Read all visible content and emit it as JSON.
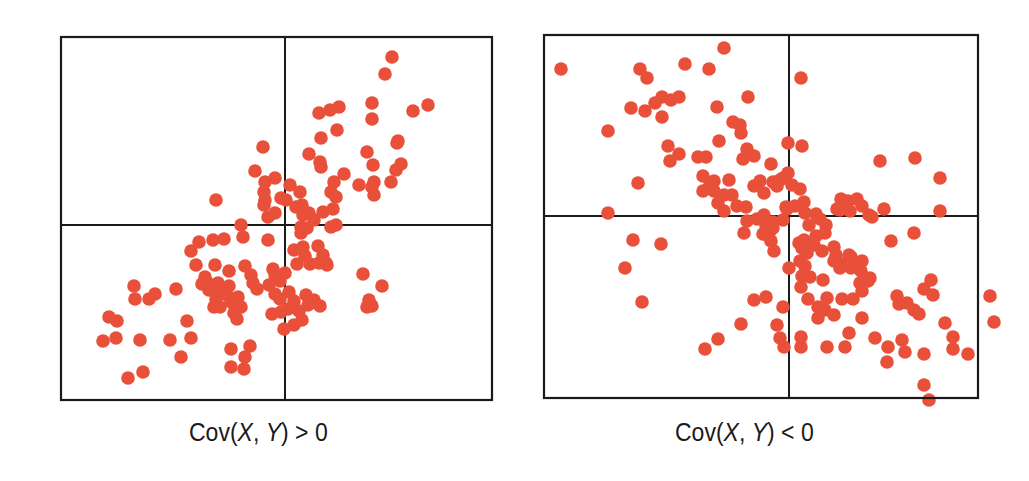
{
  "colors": {
    "point": "#E8503A",
    "frame": "#1a1a1a",
    "background": "#ffffff"
  },
  "chart_data": [
    {
      "type": "scatter",
      "title": "",
      "caption": {
        "prefix": "Cov(",
        "x": "X",
        "sep": ", ",
        "y": "Y",
        "suffix": ") > 0"
      },
      "caption_text": "Cov(X, Y) > 0",
      "xlabel": "",
      "ylabel": "",
      "grid": false,
      "axes": "centered cross-hair lines, no ticks",
      "frame": {
        "left": 61,
        "top": 37,
        "width": 431,
        "height": 363,
        "axis_x": 224,
        "axis_y": 188
      },
      "point_radius": 6.8,
      "points_px": [
        [
          331,
          20
        ],
        [
          324,
          37
        ],
        [
          311,
          66
        ],
        [
          311,
          82
        ],
        [
          352,
          74
        ],
        [
          367,
          68
        ],
        [
          336,
          106
        ],
        [
          276,
          93
        ],
        [
          258,
          76
        ],
        [
          269,
          73
        ],
        [
          278,
          70
        ],
        [
          260,
          101
        ],
        [
          259,
          125
        ],
        [
          202,
          110
        ],
        [
          248,
          117
        ],
        [
          260,
          130
        ],
        [
          229,
          148
        ],
        [
          239,
          155
        ],
        [
          270,
          155
        ],
        [
          273,
          145
        ],
        [
          275,
          160
        ],
        [
          272,
          172
        ],
        [
          275,
          188
        ],
        [
          270,
          190
        ],
        [
          306,
          115
        ],
        [
          337,
          104
        ],
        [
          283,
          137
        ],
        [
          298,
          148
        ],
        [
          313,
          145
        ],
        [
          311,
          150
        ],
        [
          313,
          158
        ],
        [
          312,
          128
        ],
        [
          340,
          127
        ],
        [
          335,
          133
        ],
        [
          330,
          145
        ],
        [
          194,
          134
        ],
        [
          204,
          145
        ],
        [
          203,
          155
        ],
        [
          204,
          163
        ],
        [
          203,
          168
        ],
        [
          220,
          161
        ],
        [
          207,
          180
        ],
        [
          214,
          176
        ],
        [
          225,
          163
        ],
        [
          235,
          170
        ],
        [
          241,
          168
        ],
        [
          242,
          178
        ],
        [
          248,
          176
        ],
        [
          253,
          183
        ],
        [
          262,
          175
        ],
        [
          240,
          190
        ],
        [
          246,
          191
        ],
        [
          155,
          163
        ],
        [
          214,
          141
        ],
        [
          180,
          188
        ],
        [
          207,
          203
        ],
        [
          182,
          200
        ],
        [
          163,
          202
        ],
        [
          138,
          205
        ],
        [
          152,
          203
        ],
        [
          130,
          214
        ],
        [
          135,
          228
        ],
        [
          154,
          228
        ],
        [
          168,
          234
        ],
        [
          240,
          196
        ],
        [
          242,
          210
        ],
        [
          244,
          219
        ],
        [
          257,
          209
        ],
        [
          262,
          218
        ],
        [
          233,
          213
        ],
        [
          236,
          227
        ],
        [
          249,
          227
        ],
        [
          258,
          226
        ],
        [
          265,
          226
        ],
        [
          184,
          229
        ],
        [
          190,
          238
        ],
        [
          192,
          246
        ],
        [
          196,
          252
        ],
        [
          212,
          232
        ],
        [
          214,
          238
        ],
        [
          219,
          244
        ],
        [
          224,
          236
        ],
        [
          157,
          246
        ],
        [
          160,
          254
        ],
        [
          166,
          258
        ],
        [
          170,
          265
        ],
        [
          173,
          276
        ],
        [
          176,
          282
        ],
        [
          180,
          270
        ],
        [
          177,
          260
        ],
        [
          148,
          253
        ],
        [
          155,
          262
        ],
        [
          159,
          270
        ],
        [
          153,
          270
        ],
        [
          208,
          248
        ],
        [
          214,
          257
        ],
        [
          219,
          262
        ],
        [
          228,
          255
        ],
        [
          233,
          264
        ],
        [
          227,
          272
        ],
        [
          211,
          277
        ],
        [
          220,
          275
        ],
        [
          238,
          274
        ],
        [
          241,
          283
        ],
        [
          245,
          258
        ],
        [
          247,
          268
        ],
        [
          253,
          263
        ],
        [
          259,
          269
        ],
        [
          266,
          228
        ],
        [
          302,
          237
        ],
        [
          308,
          263
        ],
        [
          306,
          270
        ],
        [
          311,
          269
        ],
        [
          321,
          249
        ],
        [
          126,
          284
        ],
        [
          109,
          303
        ],
        [
          170,
          312
        ],
        [
          189,
          309
        ],
        [
          184,
          320
        ],
        [
          183,
          332
        ],
        [
          170,
          330
        ],
        [
          130,
          301
        ],
        [
          120,
          320
        ],
        [
          115,
          252
        ],
        [
          94,
          257
        ],
        [
          88,
          262
        ],
        [
          74,
          262
        ],
        [
          73,
          249
        ],
        [
          56,
          284
        ],
        [
          48,
          280
        ],
        [
          79,
          303
        ],
        [
          55,
          301
        ],
        [
          42,
          304
        ],
        [
          82,
          335
        ],
        [
          67,
          341
        ],
        [
          148,
          247
        ],
        [
          144,
          240
        ],
        [
          141,
          247
        ],
        [
          168,
          249
        ],
        [
          233,
          288
        ],
        [
          223,
          292
        ]
      ]
    },
    {
      "type": "scatter",
      "title": "",
      "caption": {
        "prefix": "Cov(",
        "x": "X",
        "sep": ", ",
        "y": "Y",
        "suffix": ") < 0"
      },
      "caption_text": "Cov(X, Y) < 0",
      "xlabel": "",
      "ylabel": "",
      "grid": false,
      "axes": "centered cross-hair lines, no ticks",
      "frame": {
        "left": 544,
        "top": 35,
        "width": 434,
        "height": 363,
        "axis_x": 245,
        "axis_y": 181
      },
      "point_radius": 6.8,
      "points_px": [
        [
          17,
          34
        ],
        [
          96,
          34
        ],
        [
          103,
          43
        ],
        [
          141,
          29
        ],
        [
          165,
          34
        ],
        [
          180,
          13
        ],
        [
          257,
          43
        ],
        [
          118,
          62
        ],
        [
          127,
          65
        ],
        [
          135,
          62
        ],
        [
          111,
          68
        ],
        [
          87,
          73
        ],
        [
          101,
          76
        ],
        [
          118,
          82
        ],
        [
          204,
          62
        ],
        [
          173,
          72
        ],
        [
          64,
          96
        ],
        [
          189,
          87
        ],
        [
          196,
          90
        ],
        [
          197,
          98
        ],
        [
          175,
          106
        ],
        [
          203,
          114
        ],
        [
          244,
          108
        ],
        [
          258,
          111
        ],
        [
          124,
          111
        ],
        [
          126,
          126
        ],
        [
          135,
          119
        ],
        [
          154,
          122
        ],
        [
          159,
          141
        ],
        [
          165,
          152
        ],
        [
          162,
          122
        ],
        [
          159,
          156
        ],
        [
          170,
          146
        ],
        [
          170,
          156
        ],
        [
          180,
          160
        ],
        [
          185,
          145
        ],
        [
          188,
          160
        ],
        [
          174,
          168
        ],
        [
          180,
          176
        ],
        [
          199,
          124
        ],
        [
          210,
          121
        ],
        [
          227,
          129
        ],
        [
          229,
          147
        ],
        [
          239,
          143
        ],
        [
          244,
          138
        ],
        [
          233,
          151
        ],
        [
          210,
          151
        ],
        [
          216,
          146
        ],
        [
          220,
          158
        ],
        [
          202,
          172
        ],
        [
          193,
          171
        ],
        [
          203,
          186
        ],
        [
          200,
          198
        ],
        [
          213,
          184
        ],
        [
          220,
          180
        ],
        [
          236,
          145
        ],
        [
          248,
          150
        ],
        [
          256,
          154
        ],
        [
          260,
          167
        ],
        [
          242,
          172
        ],
        [
          243,
          174
        ],
        [
          251,
          171
        ],
        [
          261,
          178
        ],
        [
          239,
          185
        ],
        [
          229,
          187
        ],
        [
          222,
          191
        ],
        [
          219,
          199
        ],
        [
          226,
          196
        ],
        [
          229,
          193
        ],
        [
          223,
          200
        ],
        [
          227,
          206
        ],
        [
          293,
          174
        ],
        [
          297,
          164
        ],
        [
          304,
          166
        ],
        [
          300,
          170
        ],
        [
          313,
          164
        ],
        [
          306,
          176
        ],
        [
          318,
          171
        ],
        [
          325,
          180
        ],
        [
          328,
          182
        ],
        [
          296,
          175
        ],
        [
          265,
          190
        ],
        [
          272,
          179
        ],
        [
          276,
          184
        ],
        [
          282,
          190
        ],
        [
          281,
          198
        ],
        [
          272,
          201
        ],
        [
          270,
          210
        ],
        [
          347,
          206
        ],
        [
          370,
          198
        ],
        [
          371,
          123
        ],
        [
          396,
          143
        ],
        [
          336,
          126
        ],
        [
          396,
          176
        ],
        [
          340,
          174
        ],
        [
          255,
          208
        ],
        [
          258,
          213
        ],
        [
          263,
          218
        ],
        [
          278,
          216
        ],
        [
          290,
          212
        ],
        [
          292,
          220
        ],
        [
          297,
          229
        ],
        [
          305,
          220
        ],
        [
          307,
          222
        ],
        [
          261,
          231
        ],
        [
          258,
          241
        ],
        [
          266,
          242
        ],
        [
          279,
          245
        ],
        [
          290,
          226
        ],
        [
          296,
          233
        ],
        [
          307,
          233
        ],
        [
          318,
          226
        ],
        [
          310,
          231
        ],
        [
          230,
          216
        ],
        [
          245,
          233
        ],
        [
          257,
          252
        ],
        [
          264,
          264
        ],
        [
          274,
          272
        ],
        [
          281,
          275
        ],
        [
          274,
          283
        ],
        [
          290,
          280
        ],
        [
          283,
          263
        ],
        [
          298,
          264
        ],
        [
          316,
          248
        ],
        [
          309,
          264
        ],
        [
          318,
          256
        ],
        [
          324,
          246
        ],
        [
          326,
          243
        ],
        [
          317,
          236
        ],
        [
          210,
          265
        ],
        [
          222,
          262
        ],
        [
          239,
          272
        ],
        [
          233,
          290
        ],
        [
          240,
          312
        ],
        [
          257,
          312
        ],
        [
          197,
          289
        ],
        [
          174,
          304
        ],
        [
          260,
          205
        ],
        [
          256,
          226
        ],
        [
          236,
          303
        ],
        [
          257,
          302
        ],
        [
          283,
          312
        ],
        [
          301,
          312
        ],
        [
          305,
          298
        ],
        [
          318,
          283
        ],
        [
          331,
          303
        ],
        [
          344,
          312
        ],
        [
          380,
          254
        ],
        [
          387,
          245
        ],
        [
          389,
          260
        ],
        [
          353,
          261
        ],
        [
          355,
          269
        ],
        [
          363,
          268
        ],
        [
          370,
          275
        ],
        [
          375,
          279
        ],
        [
          401,
          288
        ],
        [
          409,
          302
        ],
        [
          409,
          314
        ],
        [
          358,
          305
        ],
        [
          343,
          327
        ],
        [
          380,
          319
        ],
        [
          380,
          350
        ],
        [
          424,
          319
        ],
        [
          361,
          317
        ],
        [
          385,
          365
        ],
        [
          446,
          261
        ],
        [
          450,
          287
        ],
        [
          81,
          233
        ],
        [
          117,
          209
        ],
        [
          64,
          178
        ],
        [
          94,
          148
        ],
        [
          89,
          205
        ],
        [
          98,
          267
        ],
        [
          161,
          314
        ]
      ]
    }
  ]
}
